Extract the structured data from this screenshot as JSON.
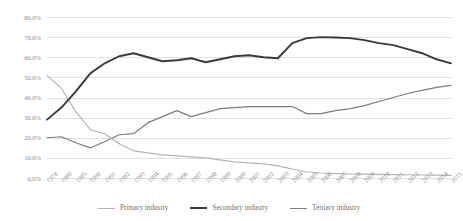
{
  "chart_data": {
    "type": "line",
    "title": "",
    "xlabel": "",
    "ylabel": "",
    "ylim": [
      0,
      80
    ],
    "ytick_labels": [
      "80.0%",
      "70.0%",
      "60.0%",
      "50.0%",
      "40.0%",
      "30.0%",
      "20.0%",
      "10.0%",
      "0.0%"
    ],
    "ytick_values": [
      80,
      70,
      60,
      50,
      40,
      30,
      20,
      10,
      0
    ],
    "grid": true,
    "legend_position": "bottom",
    "categories": [
      "1978",
      "1980",
      "1985",
      "1990",
      "1991",
      "1992",
      "1993",
      "1994",
      "1995",
      "1996",
      "1997",
      "1998",
      "1999",
      "2000",
      "2001",
      "2002",
      "2003",
      "2004",
      "2005",
      "2006",
      "2007",
      "2008",
      "2009",
      "2010",
      "2011",
      "2012",
      "2013",
      "2014",
      "2015"
    ],
    "series": [
      {
        "name": "Primary industry",
        "color": "#b4b4b4",
        "values": [
          51.0,
          44.5,
          33.0,
          24.0,
          22.0,
          17.0,
          13.5,
          12.5,
          11.5,
          11.0,
          10.5,
          10.0,
          9.0,
          8.0,
          7.5,
          7.0,
          6.0,
          4.5,
          3.0,
          2.5,
          2.2,
          2.0,
          1.9,
          1.8,
          1.7,
          1.6,
          1.5,
          1.4,
          1.3
        ]
      },
      {
        "name": "Secondary industry",
        "color": "#3a3a3a",
        "values": [
          29.0,
          35.0,
          43.0,
          52.0,
          57.0,
          60.5,
          62.0,
          60.0,
          58.0,
          58.5,
          59.5,
          57.5,
          59.0,
          60.5,
          61.0,
          60.0,
          59.5,
          67.0,
          69.5,
          70.0,
          69.8,
          69.5,
          68.5,
          67.0,
          66.0,
          64.0,
          62.0,
          59.0,
          57.0
        ]
      },
      {
        "name": "Tertiary industry",
        "color": "#7d7d7d",
        "values": [
          20.0,
          20.5,
          17.5,
          15.0,
          18.0,
          21.5,
          22.0,
          27.5,
          30.5,
          33.5,
          30.5,
          32.5,
          34.5,
          35.0,
          35.5,
          35.5,
          35.5,
          35.5,
          32.0,
          32.0,
          33.5,
          34.5,
          36.0,
          38.0,
          40.0,
          42.0,
          43.5,
          45.0,
          46.0
        ]
      }
    ]
  },
  "legend": {
    "items": [
      {
        "label": "Primary industry",
        "swatch": "primary"
      },
      {
        "label": "Secondary industry",
        "swatch": "secondary"
      },
      {
        "label": "Tertiary industry",
        "swatch": "tertiary"
      }
    ]
  }
}
